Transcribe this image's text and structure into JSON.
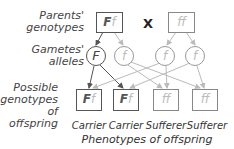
{
  "labels": {
    "parents": "Parents' genotypes",
    "parents_l1": "Parents'",
    "parents_l2": "genotypes",
    "gametes_l1": "Gametes'",
    "gametes_l2": "alleles",
    "offspring_l1": "Possible",
    "offspring_l2": "genotypes",
    "offspring_l3": "of offspring",
    "cross_symbol": "X",
    "phenotypes_title": "Phenotypes of offspring"
  },
  "parents": [
    {
      "genotype": "Ff",
      "dominant": "F",
      "recessive": "f"
    },
    {
      "genotype": "ff",
      "dominant": "",
      "recessive": "ff"
    }
  ],
  "gametes": [
    {
      "allele": "F",
      "type": "dominant"
    },
    {
      "allele": "f",
      "type": "recessive"
    },
    {
      "allele": "f",
      "type": "recessive"
    },
    {
      "allele": "f",
      "type": "recessive"
    }
  ],
  "offspring": [
    {
      "dominant": "F",
      "recessive": "f",
      "phenotype": "Carrier"
    },
    {
      "dominant": "F",
      "recessive": "f",
      "phenotype": "Carrier"
    },
    {
      "dominant": "",
      "recessive": "ff",
      "phenotype": "Sufferer"
    },
    {
      "dominant": "",
      "recessive": "ff",
      "phenotype": "Sufferer"
    }
  ],
  "colors": {
    "dominant_line": "#555555",
    "recessive_line": "#bbbbbb"
  }
}
